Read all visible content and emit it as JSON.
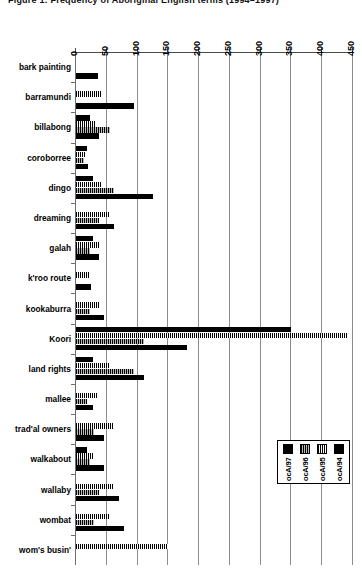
{
  "chart_data": {
    "type": "bar",
    "orientation": "horizontal",
    "title": "Figure 1:  Frequency of Aboriginal English terms (1994–1997)",
    "xlabel": "",
    "ylabel": "",
    "xlim": [
      0,
      450
    ],
    "xticks": [
      0,
      50,
      100,
      150,
      200,
      250,
      300,
      350,
      400,
      450
    ],
    "grid": true,
    "legend_position": "bottom-right",
    "categories": [
      "bark painting",
      "barramundi",
      "billabong",
      "coroborree",
      "dingo",
      "dreaming",
      "galah",
      "k'roo route",
      "kookaburra",
      "Koori",
      "land rights",
      "mallee",
      "trad'al owners",
      "walkabout",
      "wallaby",
      "wombat",
      "wom's busin'"
    ],
    "series": [
      {
        "name": "ocA/94",
        "fill": "solid",
        "values": [
          0,
          0,
          22,
          18,
          28,
          0,
          27,
          0,
          0,
          350,
          28,
          0,
          0,
          18,
          0,
          0,
          0
        ]
      },
      {
        "name": "ocA/95",
        "fill": "hatch",
        "values": [
          0,
          40,
          33,
          14,
          40,
          55,
          38,
          22,
          38,
          440,
          55,
          35,
          60,
          30,
          62,
          55,
          150
        ]
      },
      {
        "name": "ocA/96",
        "fill": "stipple",
        "values": [
          0,
          0,
          55,
          13,
          62,
          38,
          22,
          0,
          22,
          110,
          95,
          18,
          30,
          22,
          38,
          30,
          0
        ]
      },
      {
        "name": "ocA/97",
        "fill": "solid",
        "values": [
          35,
          95,
          38,
          20,
          125,
          62,
          38,
          25,
          45,
          180,
          110,
          28,
          45,
          45,
          70,
          78,
          0
        ]
      }
    ]
  },
  "legend": {
    "items": [
      {
        "label": "ocA/97",
        "fill": "solid"
      },
      {
        "label": "ocA/96",
        "fill": "stipple"
      },
      {
        "label": "ocA/95",
        "fill": "hatch"
      },
      {
        "label": "ocA/94",
        "fill": "solid"
      }
    ]
  },
  "colors": {
    "bar": "#000000",
    "axis": "#4a4a4a",
    "grid": "#8d8d8d",
    "background": "#ffffff"
  }
}
